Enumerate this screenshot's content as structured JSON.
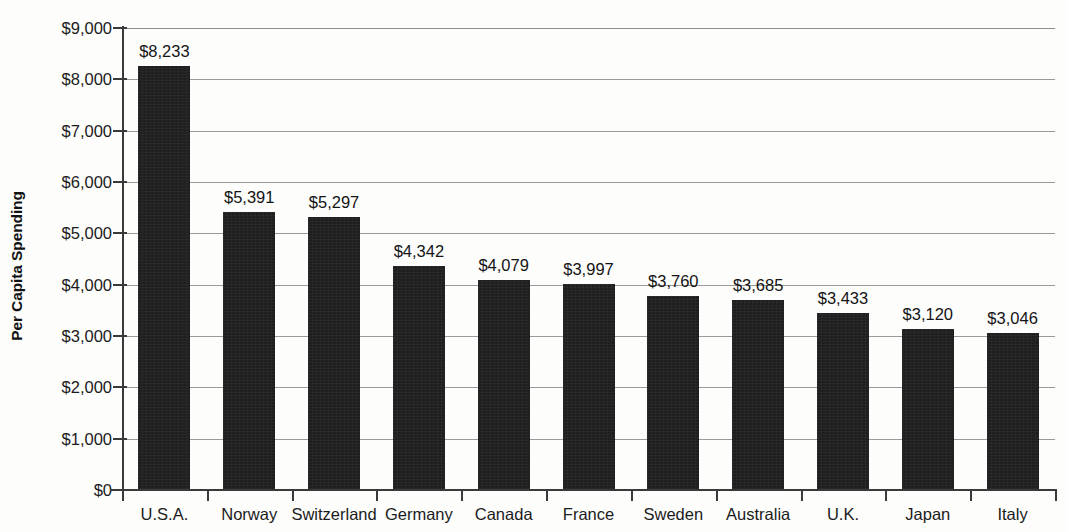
{
  "chart_data": {
    "type": "bar",
    "title": "",
    "xlabel": "",
    "ylabel": "Per Capita Spending",
    "ylim": [
      0,
      9000
    ],
    "ytick_step": 1000,
    "grid": true,
    "legend": false,
    "orientation": "vertical",
    "bar_color": "#1f1f1f",
    "gridline_color": "#9a9a9a",
    "axis_color": "#3a3a3a",
    "background_color": "#fdfdfc",
    "categories": [
      "U.S.A.",
      "Norway",
      "Switzerland",
      "Germany",
      "Canada",
      "France",
      "Sweden",
      "Australia",
      "U.K.",
      "Japan",
      "Italy"
    ],
    "values": [
      8233,
      5391,
      5297,
      4342,
      4079,
      3997,
      3760,
      3685,
      3433,
      3120,
      3046
    ],
    "data_labels": [
      "$8,233",
      "$5,391",
      "$5,297",
      "$4,342",
      "$4,079",
      "$3,997",
      "$3,760",
      "$3,685",
      "$3,433",
      "$3,120",
      "$3,046"
    ],
    "ytick_labels": [
      "$9,000",
      "$8,000",
      "$7,000",
      "$6,000",
      "$5,000",
      "$4,000",
      "$3,000",
      "$2,000",
      "$1,000",
      "$0"
    ],
    "ytick_values": [
      9000,
      8000,
      7000,
      6000,
      5000,
      4000,
      3000,
      2000,
      1000,
      0
    ]
  }
}
